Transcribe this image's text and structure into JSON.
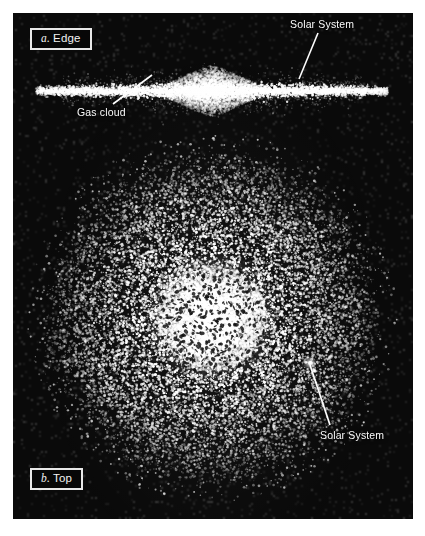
{
  "figure": {
    "background_color": "#ffffff",
    "plate_color": "#0a0a0a",
    "star_color": "#ffffff",
    "label_color": "#fbfbfb",
    "box_border_color": "#e8e8e8"
  },
  "panels": [
    {
      "id": "a",
      "index_label": "a.",
      "title_label": "Edge",
      "caption_text": "a. Edge",
      "view": "edge-on"
    },
    {
      "id": "b",
      "index_label": "b.",
      "title_label": "Top",
      "caption_text": "b. Top",
      "view": "top-down"
    }
  ],
  "annotations": [
    {
      "id": "solar-system-edge",
      "text": "Solar System",
      "panel": "a",
      "label_x": 290,
      "label_y": 18,
      "leader_from_x": 318,
      "leader_from_y": 33,
      "leader_to_x": 299,
      "leader_to_y": 79
    },
    {
      "id": "gas-cloud",
      "text": "Gas cloud",
      "panel": "a",
      "label_x": 77,
      "label_y": 106,
      "leader_from_x": 113,
      "leader_from_y": 104,
      "leader_to_x": 152,
      "leader_to_y": 75
    },
    {
      "id": "solar-system-top",
      "text": "Solar System",
      "panel": "b",
      "label_x": 320,
      "label_y": 429,
      "leader_from_x": 330,
      "leader_from_y": 425,
      "leader_to_x": 310,
      "leader_to_y": 365
    }
  ],
  "chart_data": {
    "type": "scatter",
    "edge_view": {
      "center_x": 212,
      "center_y": 78,
      "disk_half_length": 176,
      "disk_half_thickness": 3.2,
      "bulge_radius_x": 58,
      "bulge_radius_y": 20,
      "halo_radius_x": 120,
      "halo_radius_y": 9,
      "star_count_disk": 4200,
      "star_count_bulge": 3200,
      "star_count_halo": 1500
    },
    "top_view": {
      "center_x": 212,
      "center_y": 305,
      "outer_radius": 158,
      "core_radius": 44,
      "arm_count": 9,
      "arm_pitch": 0.52,
      "arm_turns": 1.45,
      "star_count_arms": 14000,
      "star_count_core": 5200,
      "star_count_scatter": 1600,
      "solar_marker_x": 310,
      "solar_marker_y": 363,
      "solar_marker_radius": 4
    }
  }
}
